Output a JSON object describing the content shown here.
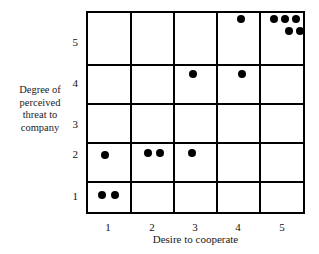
{
  "chart_data": {
    "type": "scatter",
    "title": "",
    "xlabel": "Desire to cooperate",
    "ylabel": "Degree of perceived threat to company",
    "ylabel_lines": [
      "Degree of",
      "perceived",
      "threat to",
      "company"
    ],
    "xticks": [
      "1",
      "2",
      "3",
      "4",
      "5"
    ],
    "yticks": [
      "5",
      "4",
      "3",
      "2",
      "1"
    ],
    "xlim": [
      0.5,
      5.5
    ],
    "ylim": [
      0.5,
      5.5
    ],
    "grid": true,
    "legend": null,
    "marker": "filled-circle",
    "marker_color": "#000000",
    "points": [
      {
        "x": 1,
        "y": 1,
        "jx": -0.18,
        "jy": 0.02
      },
      {
        "x": 1,
        "y": 1,
        "jx": 0.12,
        "jy": 0.02
      },
      {
        "x": 1,
        "y": 2,
        "jx": -0.12,
        "jy": 0.0
      },
      {
        "x": 2,
        "y": 2,
        "jx": -0.14,
        "jy": 0.06
      },
      {
        "x": 2,
        "y": 2,
        "jx": 0.14,
        "jy": 0.05
      },
      {
        "x": 3,
        "y": 2,
        "jx": -0.12,
        "jy": 0.04
      },
      {
        "x": 3,
        "y": 4,
        "jx": -0.1,
        "jy": 0.0
      },
      {
        "x": 4,
        "y": 4,
        "jx": 0.02,
        "jy": 0.0
      },
      {
        "x": 4,
        "y": 5,
        "jx": 0.0,
        "jy": 0.36
      },
      {
        "x": 5,
        "y": 5,
        "jx": -0.26,
        "jy": 0.36
      },
      {
        "x": 5,
        "y": 5,
        "jx": 0.0,
        "jy": 0.36
      },
      {
        "x": 5,
        "y": 5,
        "jx": 0.26,
        "jy": 0.36
      },
      {
        "x": 5,
        "y": 5,
        "jx": 0.08,
        "jy": 0.06
      },
      {
        "x": 5,
        "y": 5,
        "jx": 0.34,
        "jy": 0.06
      }
    ],
    "counts_by_cell": {
      "1,1": 2,
      "1,2": 1,
      "2,2": 2,
      "3,2": 1,
      "3,4": 1,
      "4,4": 1,
      "4,5": 1,
      "5,5": 5
    }
  }
}
